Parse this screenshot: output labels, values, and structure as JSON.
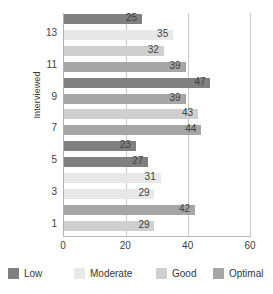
{
  "chart_data": {
    "type": "bar",
    "orientation": "horizontal",
    "title": "",
    "xlabel": "",
    "ylabel": "Interviewed",
    "xlim": [
      0,
      60
    ],
    "xticks": [
      0,
      20,
      40,
      60
    ],
    "yticks": [
      13,
      11,
      9,
      7,
      5,
      3,
      1
    ],
    "grid": true,
    "legend_position": "bottom",
    "series": [
      {
        "name": "Low",
        "color": "#808080"
      },
      {
        "name": "Moderate",
        "color": "#e8e8e8"
      },
      {
        "name": "Good",
        "color": "#cfcfcf"
      },
      {
        "name": "Optimal",
        "color": "#a6a6a6"
      }
    ],
    "bars": [
      {
        "value": 25,
        "series": "Low",
        "label": "25"
      },
      {
        "value": 35,
        "series": "Moderate",
        "label": "35"
      },
      {
        "value": 32,
        "series": "Good",
        "label": "32"
      },
      {
        "value": 39,
        "series": "Optimal",
        "label": "39"
      },
      {
        "value": 47,
        "series": "Low",
        "label": "47"
      },
      {
        "value": 39,
        "series": "Optimal",
        "label": "39"
      },
      {
        "value": 43,
        "series": "Good",
        "label": "43"
      },
      {
        "value": 44,
        "series": "Optimal",
        "label": "44"
      },
      {
        "value": 23,
        "series": "Low",
        "label": "23"
      },
      {
        "value": 27,
        "series": "Low",
        "label": "27"
      },
      {
        "value": 31,
        "series": "Moderate",
        "label": "31"
      },
      {
        "value": 29,
        "series": "Moderate",
        "label": "29"
      },
      {
        "value": 42,
        "series": "Optimal",
        "label": "42"
      },
      {
        "value": 29,
        "series": "Good",
        "label": "29"
      }
    ]
  },
  "axis": {
    "y_title": "Interviewed",
    "y_ticks": [
      "13",
      "11",
      "9",
      "7",
      "5",
      "3",
      "1"
    ],
    "x_ticks": [
      "0",
      "20",
      "40",
      "60"
    ]
  },
  "legend": {
    "items": [
      {
        "label": "Low",
        "color": "#808080"
      },
      {
        "label": "Moderate",
        "color": "#e8e8e8"
      },
      {
        "label": "Good",
        "color": "#cfcfcf"
      },
      {
        "label": "Optimal",
        "color": "#a6a6a6"
      }
    ]
  }
}
